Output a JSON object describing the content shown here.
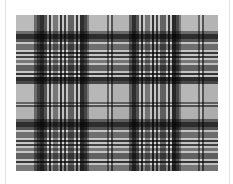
{
  "image": {
    "subject": "tartan plaid fabric pattern",
    "palette": {
      "background": "#ffffff",
      "base": "#d4d4d4",
      "frame_line": "#e2e2e2"
    },
    "vertical_stripes": [
      {
        "x": 0,
        "w": 18,
        "c": "#f0f0f0"
      },
      {
        "x": 18,
        "w": 3,
        "c": "#8a8a8a"
      },
      {
        "x": 21,
        "w": 3,
        "c": "#555555"
      },
      {
        "x": 24,
        "w": 4,
        "c": "#3a3a3a"
      },
      {
        "x": 28,
        "w": 3,
        "c": "#6d6d6d"
      },
      {
        "x": 33,
        "w": 2,
        "c": "#4a4a4a"
      },
      {
        "x": 37,
        "w": 5,
        "c": "#9a9a9a"
      },
      {
        "x": 44,
        "w": 2,
        "c": "#3e3e3e"
      },
      {
        "x": 48,
        "w": 2,
        "c": "#555555"
      },
      {
        "x": 52,
        "w": 6,
        "c": "#7d7d7d"
      },
      {
        "x": 60,
        "w": 2,
        "c": "#454545"
      },
      {
        "x": 64,
        "w": 4,
        "c": "#3a3a3a"
      },
      {
        "x": 68,
        "w": 3,
        "c": "#5c5c5c"
      },
      {
        "x": 71,
        "w": 2,
        "c": "#999999"
      },
      {
        "x": 73,
        "w": 18,
        "c": "#ededed"
      },
      {
        "x": 91,
        "w": 2,
        "c": "#808080"
      },
      {
        "x": 95,
        "w": 2,
        "c": "#6a6a6a"
      },
      {
        "x": 97,
        "w": 16,
        "c": "#e6e6e6"
      },
      {
        "x": 113,
        "w": 3,
        "c": "#7a7a7a"
      },
      {
        "x": 116,
        "w": 4,
        "c": "#3a3a3a"
      },
      {
        "x": 120,
        "w": 3,
        "c": "#6d6d6d"
      },
      {
        "x": 125,
        "w": 2,
        "c": "#4a4a4a"
      },
      {
        "x": 129,
        "w": 5,
        "c": "#9a9a9a"
      },
      {
        "x": 136,
        "w": 2,
        "c": "#3e3e3e"
      },
      {
        "x": 140,
        "w": 2,
        "c": "#555555"
      },
      {
        "x": 144,
        "w": 6,
        "c": "#7d7d7d"
      },
      {
        "x": 152,
        "w": 2,
        "c": "#454545"
      },
      {
        "x": 156,
        "w": 4,
        "c": "#333333"
      },
      {
        "x": 160,
        "w": 3,
        "c": "#5c5c5c"
      },
      {
        "x": 163,
        "w": 2,
        "c": "#999999"
      },
      {
        "x": 165,
        "w": 17,
        "c": "#ededed"
      },
      {
        "x": 182,
        "w": 2,
        "c": "#808080"
      },
      {
        "x": 186,
        "w": 2,
        "c": "#6a6a6a"
      },
      {
        "x": 188,
        "w": 14,
        "c": "#e6e6e6"
      }
    ],
    "horizontal_stripes": [
      {
        "y": 0,
        "h": 16,
        "c": "#f0f0f0"
      },
      {
        "y": 16,
        "h": 3,
        "c": "#8a8a8a"
      },
      {
        "y": 19,
        "h": 5,
        "c": "#3a3a3a"
      },
      {
        "y": 24,
        "h": 3,
        "c": "#6d6d6d"
      },
      {
        "y": 29,
        "h": 6,
        "c": "#8f8f8f"
      },
      {
        "y": 37,
        "h": 2,
        "c": "#4a4a4a"
      },
      {
        "y": 41,
        "h": 2,
        "c": "#555555"
      },
      {
        "y": 45,
        "h": 3,
        "c": "#9a9a9a"
      },
      {
        "y": 50,
        "h": 6,
        "c": "#7d7d7d"
      },
      {
        "y": 58,
        "h": 2,
        "c": "#454545"
      },
      {
        "y": 62,
        "h": 4,
        "c": "#3a3a3a"
      },
      {
        "y": 66,
        "h": 3,
        "c": "#5c5c5c"
      },
      {
        "y": 69,
        "h": 18,
        "c": "#ededed"
      },
      {
        "y": 87,
        "h": 2,
        "c": "#808080"
      },
      {
        "y": 90,
        "h": 2,
        "c": "#6a6a6a"
      },
      {
        "y": 92,
        "h": 12,
        "c": "#e6e6e6"
      },
      {
        "y": 104,
        "h": 3,
        "c": "#7a7a7a"
      },
      {
        "y": 107,
        "h": 5,
        "c": "#3a3a3a"
      },
      {
        "y": 112,
        "h": 3,
        "c": "#6d6d6d"
      },
      {
        "y": 117,
        "h": 6,
        "c": "#8f8f8f"
      },
      {
        "y": 125,
        "h": 2,
        "c": "#4a4a4a"
      },
      {
        "y": 129,
        "h": 2,
        "c": "#555555"
      },
      {
        "y": 133,
        "h": 3,
        "c": "#9a9a9a"
      },
      {
        "y": 138,
        "h": 6,
        "c": "#7d7d7d"
      },
      {
        "y": 146,
        "h": 2,
        "c": "#454545"
      },
      {
        "y": 150,
        "h": 6,
        "c": "#9a9a9a"
      }
    ]
  }
}
